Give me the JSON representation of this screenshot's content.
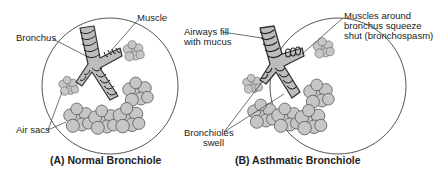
{
  "panels": [
    {
      "id": "A",
      "caption": "(A) Normal Bronchiole",
      "labels": {
        "muscle": "Muscle",
        "bronchus": "Bronchus",
        "air_sacs": "Air sacs"
      }
    },
    {
      "id": "B",
      "caption": "(B) Asthmatic Bronchiole",
      "labels": {
        "airways_line1": "Airways fill",
        "airways_line2": "with mucus",
        "muscles_line1": "Muscles around",
        "muscles_line2": "bronchus squeeze",
        "muscles_line3": "shut (bronchospasm)",
        "bronchioles_line1": "Bronchioles",
        "bronchioles_line2": "swell"
      }
    }
  ],
  "colors": {
    "airway_fill": "#bdbdbd",
    "sac_fill": "#c8c8c8",
    "outline": "#333333",
    "background": "#ffffff"
  }
}
